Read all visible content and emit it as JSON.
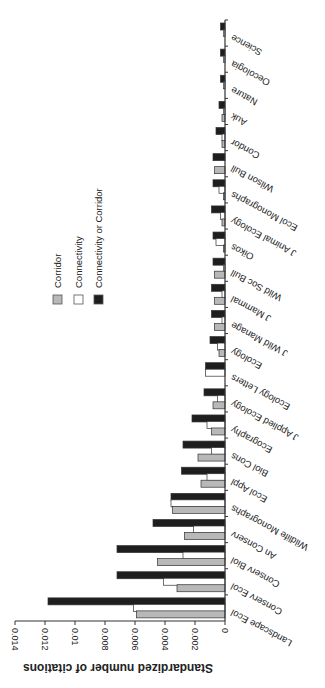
{
  "chart_data": {
    "type": "bar",
    "orientation": "horizontal (figure rotated 180°)",
    "title": "",
    "xlabel": "",
    "ylabel": "Standardized number of citations",
    "ylim": [
      0,
      0.014
    ],
    "yticks": [
      "0",
      "0.002",
      "0.004",
      "0.006",
      "0.008",
      "0.01",
      "0.012",
      "0.014"
    ],
    "categories": [
      "Landscape Ecol",
      "Conserv Ecol",
      "Conserv Biol",
      "An Conserv",
      "Wildlife Monographs",
      "Ecol Appl",
      "Biol Cons",
      "Ecography",
      "J Applied Ecology",
      "Ecology Letters",
      "Ecology",
      "J Wild Manage",
      "J Mammal",
      "Wild Soc Bull",
      "Oikos",
      "J Animal Ecology",
      "Ecol Monographs",
      "Wilson Bull",
      "Condor",
      "Auk",
      "Nature",
      "Oecologia",
      "Science"
    ],
    "series": [
      {
        "name": "Corridor",
        "color": "#b8b8b8",
        "values": [
          0.0059,
          0.0032,
          0.0045,
          0.0027,
          0.0035,
          0.0016,
          0.0018,
          0.0009,
          0.0008,
          0.0,
          0.0004,
          0.0007,
          0.0007,
          0.0007,
          0.0001,
          0.0002,
          0.0001,
          0.0007,
          0.0002,
          0.0002,
          0.0,
          0.0,
          0.0
        ]
      },
      {
        "name": "Connectivity",
        "color": "#ffffff",
        "values": [
          0.0061,
          0.0041,
          0.0028,
          0.0021,
          0.0036,
          0.0012,
          0.0009,
          0.0012,
          0.0005,
          0.0013,
          0.0005,
          0.0002,
          0.0002,
          0.0001,
          0.0006,
          0.0003,
          0.0004,
          0.0,
          0.0002,
          0.0001,
          0.0001,
          0.0001,
          0.0001
        ]
      },
      {
        "name": "Connectivity or Corridor",
        "color": "#1e1e1e",
        "values": [
          0.0118,
          0.0072,
          0.0072,
          0.0048,
          0.0036,
          0.0029,
          0.0028,
          0.0022,
          0.0014,
          0.0013,
          0.001,
          0.0009,
          0.0009,
          0.0008,
          0.0008,
          0.0009,
          0.0008,
          0.0008,
          0.0006,
          0.0004,
          0.0003,
          0.0003,
          0.0003
        ]
      }
    ],
    "legend": {
      "position": "inside, upper-left (rotated)",
      "entries": [
        "Corridor",
        "Connectivity",
        "Connectivity or Corridor"
      ]
    },
    "grid": false
  }
}
